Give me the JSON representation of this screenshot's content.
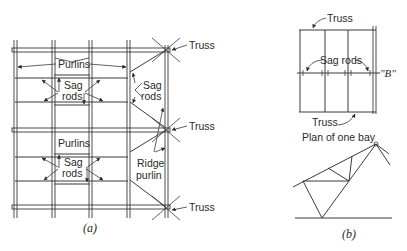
{
  "figure_a": {
    "caption": "(a)",
    "labels": {
      "truss_top": "Truss",
      "truss_middle": "Truss",
      "truss_bottom": "Truss",
      "purlins_top": "Purlins",
      "purlins_bottom": "Purlins",
      "sag_rods_top_left_1": "Sag",
      "sag_rods_top_left_2": "rods",
      "sag_rods_top_right_1": "Sag",
      "sag_rods_top_right_2": "rods",
      "sag_rods_bottom_1": "Sag",
      "sag_rods_bottom_2": "rods",
      "ridge_purlin_1": "Ridge",
      "ridge_purlin_2": "purlin"
    }
  },
  "figure_b": {
    "caption": "(b)",
    "labels": {
      "truss_top": "Truss",
      "truss_bottom": "Truss",
      "sag_rods": "Sag rods",
      "point_b": "\"B\"",
      "plan_title": "Plan of one bay"
    }
  },
  "colors": {
    "line": "#3a3a3a",
    "text": "#2a2a2a",
    "background": "#ffffff"
  }
}
